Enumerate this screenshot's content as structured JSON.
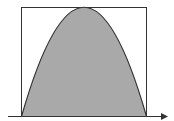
{
  "diagram": {
    "colors": {
      "background": "#ffffff",
      "fill": "#a9a9a9",
      "stroke": "#333333"
    },
    "rectangle": {
      "x": 21,
      "y": 7,
      "width": 125,
      "height": 109
    },
    "parabola": {
      "left_root": [
        21,
        116
      ],
      "vertex": [
        84,
        7
      ],
      "right_root": [
        146,
        116
      ]
    },
    "axis": {
      "x1": 8,
      "x2": 168,
      "y": 116,
      "arrow": "right"
    }
  }
}
